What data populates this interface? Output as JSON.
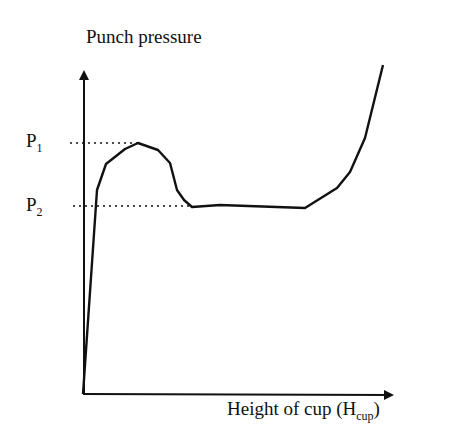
{
  "chart_data": {
    "type": "line",
    "title": "",
    "ylabel": "Punch pressure",
    "xlabel": "Height of cup (H_cup)",
    "xlabel_main": "Height of cup (H",
    "xlabel_sub": "cup",
    "xlabel_end": ")",
    "grid": false,
    "annotations": [
      {
        "label": "P",
        "sub": "1",
        "meaning": "peak punch pressure (dotted reference line)"
      },
      {
        "label": "P",
        "sub": "2",
        "meaning": "steady punch pressure (dotted reference line)"
      }
    ],
    "series": [
      {
        "name": "Punch pressure curve",
        "points_px": [
          [
            83,
            394
          ],
          [
            97,
            190
          ],
          [
            106,
            164
          ],
          [
            125,
            149
          ],
          [
            138,
            143
          ],
          [
            158,
            150
          ],
          [
            170,
            163
          ],
          [
            177,
            190
          ],
          [
            184,
            200
          ],
          [
            192,
            207
          ],
          [
            220,
            205
          ],
          [
            305,
            208
          ],
          [
            337,
            188
          ],
          [
            350,
            172
          ],
          [
            365,
            138
          ],
          [
            383,
            65
          ]
        ]
      }
    ]
  }
}
